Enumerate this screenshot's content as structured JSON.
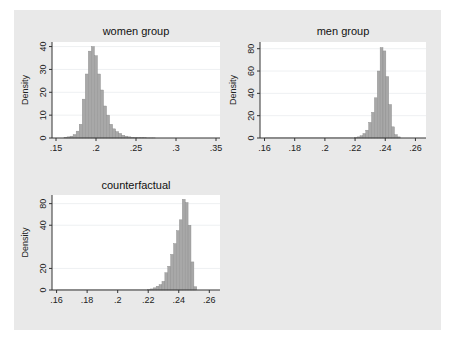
{
  "figure": {
    "background": "#e9e9e9",
    "plot_background": "#ffffff",
    "bar_color": "#a8a8a8",
    "bar_edge": "#8a8a8a"
  },
  "chart_data": [
    {
      "type": "bar",
      "title": "women group",
      "xlabel": "",
      "ylabel": "Density",
      "xlim": [
        0.145,
        0.355
      ],
      "ylim": [
        0,
        42
      ],
      "xticks": [
        0.15,
        0.2,
        0.25,
        0.3,
        0.35
      ],
      "xtick_labels": [
        ".15",
        ".2",
        ".25",
        ".3",
        ".35"
      ],
      "yticks": [
        0,
        10,
        20,
        30,
        40
      ],
      "ytick_labels": [
        "0",
        "10",
        "20",
        "30",
        "40"
      ],
      "grid": true,
      "bin_width": 0.0038,
      "bin_start": 0.16,
      "values": [
        0.3,
        0.5,
        0.8,
        1.5,
        3,
        6,
        17,
        28,
        38,
        40,
        36,
        28,
        21,
        14,
        10,
        6,
        4,
        2.8,
        2,
        1.2,
        0.8,
        0.5,
        0.3,
        0.2,
        0.1,
        0.1,
        0.1,
        0.05,
        0.05,
        0.05
      ]
    },
    {
      "type": "bar",
      "title": "men group",
      "xlabel": "",
      "ylabel": "Density",
      "xlim": [
        0.157,
        0.267
      ],
      "ylim": [
        0,
        86
      ],
      "xticks": [
        0.16,
        0.18,
        0.2,
        0.22,
        0.24,
        0.26
      ],
      "xtick_labels": [
        ".16",
        ".18",
        ".2",
        ".22",
        ".24",
        ".26"
      ],
      "yticks": [
        0,
        20,
        40,
        60,
        80
      ],
      "ytick_labels": [
        "0",
        "20",
        "40",
        "60",
        "80"
      ],
      "grid": true,
      "bin_width": 0.0019,
      "bin_start": 0.2195,
      "values": [
        0.5,
        1,
        2,
        4,
        7,
        14,
        23,
        36,
        60,
        81,
        78,
        55,
        30,
        10,
        3,
        1
      ],
      "tail": {
        "from": 0.16,
        "to": 0.219,
        "value": 0.3
      }
    },
    {
      "type": "bar",
      "title": "counterfactual",
      "xlabel": "",
      "ylabel": "Density",
      "xlim": [
        0.157,
        0.267
      ],
      "ylim": [
        0,
        88
      ],
      "xticks": [
        0.16,
        0.18,
        0.2,
        0.22,
        0.24,
        0.26
      ],
      "xtick_labels": [
        ".16",
        ".18",
        ".2",
        ".22",
        ".24",
        ".26"
      ],
      "yticks": [
        0,
        20,
        60,
        80
      ],
      "ytick_labels": [
        "0",
        "20",
        "40",
        "80"
      ],
      "grid": true,
      "bin_width": 0.0019,
      "bin_start": 0.2195,
      "values": [
        0.5,
        1,
        2,
        3.5,
        5,
        8,
        16,
        22,
        33,
        43,
        55,
        65,
        84,
        81,
        60,
        26,
        3
      ],
      "tail": {
        "from": 0.16,
        "to": 0.219,
        "value": 0.3
      }
    }
  ],
  "panels": [
    {
      "title": "women group",
      "ylabel": "Density"
    },
    {
      "title": "men group",
      "ylabel": "Density"
    },
    {
      "title": "counterfactual",
      "ylabel": "Density"
    }
  ]
}
